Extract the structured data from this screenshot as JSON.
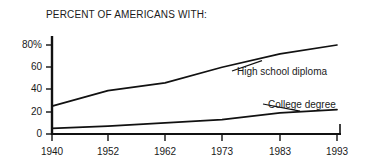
{
  "chart_data": {
    "type": "line",
    "title": "PERCENT OF AMERICANS WITH:",
    "xlabel": "",
    "ylabel": "",
    "x": [
      1940,
      1952,
      1962,
      1973,
      1983,
      1993
    ],
    "xtick_labels": [
      "1940",
      "1952",
      "1962",
      "1973",
      "1983",
      "1993"
    ],
    "ytick_labels": [
      "80%",
      "60",
      "40",
      "20",
      "0"
    ],
    "ytick_values": [
      80,
      60,
      40,
      20,
      0
    ],
    "ylim": [
      0,
      88
    ],
    "xlim": [
      1940,
      1993
    ],
    "grid": false,
    "legend_position": "inline-right",
    "series": [
      {
        "name": "High school diploma",
        "values": [
          25,
          39,
          46,
          60,
          72,
          80
        ],
        "color": "#111111",
        "label_x": 237,
        "label_y": 66
      },
      {
        "name": "College degree",
        "values": [
          5,
          7,
          10,
          13,
          19,
          22
        ],
        "color": "#111111",
        "label_x": 268,
        "label_y": 99
      }
    ],
    "axis_color": "#111111"
  },
  "axes": {
    "x_ticks_px": [
      52,
      108,
      165,
      222,
      280,
      337
    ],
    "y_ticks_px": [
      45,
      67,
      89,
      112,
      134
    ],
    "left_px": 52,
    "right_px": 341,
    "top_px": 36,
    "bottom_px": 134
  }
}
